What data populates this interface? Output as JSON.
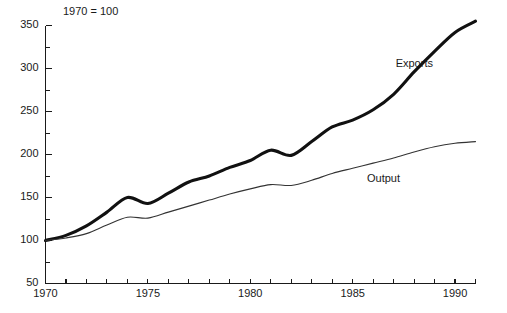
{
  "chart_data": {
    "type": "line",
    "title": "",
    "subtitle": "",
    "note": "1970 = 100",
    "xlabel": "",
    "ylabel": "",
    "xlim": [
      1970,
      1991
    ],
    "ylim": [
      50,
      350
    ],
    "ytick_values": [
      50,
      100,
      150,
      200,
      250,
      300,
      350
    ],
    "ytick_labels": [
      "50",
      "100",
      "150",
      "200",
      "250",
      "300",
      "350"
    ],
    "yminor_values": [
      75,
      125,
      175,
      225,
      275,
      325
    ],
    "xtick_values": [
      1970,
      1971,
      1972,
      1973,
      1974,
      1975,
      1976,
      1977,
      1978,
      1979,
      1980,
      1981,
      1982,
      1983,
      1984,
      1985,
      1986,
      1987,
      1988,
      1989,
      1990,
      1991
    ],
    "xtick_labels_shown": [
      "1970",
      "1975",
      "1980",
      "1985",
      "1990"
    ],
    "xtick_labels_shown_values": [
      1970,
      1975,
      1980,
      1985,
      1990
    ],
    "grid": false,
    "legend_position": "inline-annotation",
    "x": [
      1970,
      1971,
      1972,
      1973,
      1974,
      1975,
      1976,
      1977,
      1978,
      1979,
      1980,
      1981,
      1982,
      1983,
      1984,
      1985,
      1986,
      1987,
      1988,
      1989,
      1990,
      1991
    ],
    "series": [
      {
        "name": "Exports",
        "style": "thick",
        "color": "#111111",
        "label_x": 1987.1,
        "label_y": 302,
        "values": [
          100,
          106,
          117,
          133,
          150,
          143,
          155,
          168,
          175,
          185,
          193,
          205,
          199,
          215,
          232,
          240,
          252,
          270,
          296,
          320,
          342,
          355
        ]
      },
      {
        "name": "Output",
        "style": "thin",
        "color": "#333333",
        "label_x": 1985.7,
        "label_y": 168,
        "values": [
          100,
          103,
          108,
          118,
          127,
          126,
          133,
          140,
          147,
          154,
          160,
          165,
          164,
          170,
          178,
          184,
          190,
          196,
          203,
          209,
          213,
          215
        ]
      }
    ]
  },
  "annotations": {
    "exports_label": "Exports",
    "output_label": "Output",
    "index_note": "1970 = 100"
  }
}
